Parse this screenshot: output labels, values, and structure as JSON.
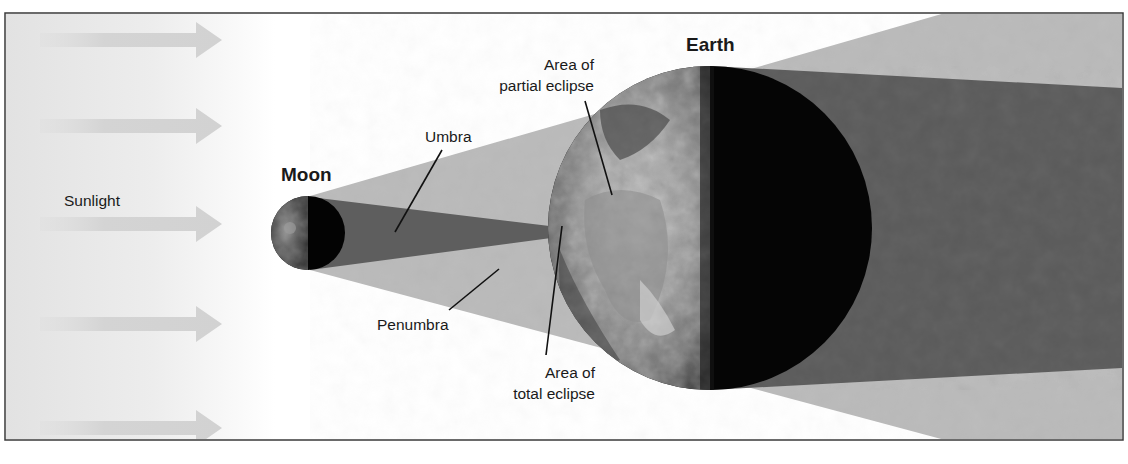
{
  "diagram": {
    "labels": {
      "sunlight": "Sunlight",
      "moon": "Moon",
      "earth": "Earth",
      "umbra": "Umbra",
      "penumbra": "Penumbra",
      "partial_eclipse_line1": "Area of",
      "partial_eclipse_line2": "partial eclipse",
      "total_eclipse_line1": "Area of",
      "total_eclipse_line2": "total eclipse"
    },
    "sunlight_arrows": [
      {
        "y": 40
      },
      {
        "y": 126
      },
      {
        "y": 224
      },
      {
        "y": 324
      },
      {
        "y": 428
      }
    ],
    "colors": {
      "frame": "#3a3a3a",
      "background": "#ffffff",
      "sunlight_gradient_start": "#e4e4e4",
      "arrow": "#d6d6d6",
      "penumbra": "#b9b9b9",
      "umbra": "#5c5c5c",
      "night_side": "#050505",
      "text": "#1a1a1a",
      "leader_line": "#111111"
    }
  }
}
